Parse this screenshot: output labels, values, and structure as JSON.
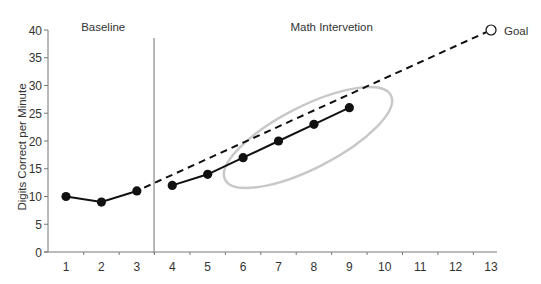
{
  "chart_data": {
    "type": "line",
    "title": "",
    "xlabel": "",
    "ylabel": "Digits Correct per Minute",
    "xlim": [
      0.5,
      13.2
    ],
    "ylim": [
      0,
      40
    ],
    "x_ticks": [
      1,
      2,
      3,
      4,
      5,
      6,
      7,
      8,
      9,
      10,
      11,
      12,
      13
    ],
    "y_ticks": [
      0,
      5,
      10,
      15,
      20,
      25,
      30,
      35,
      40
    ],
    "grid": false,
    "legend": null,
    "phases": [
      {
        "name": "Baseline",
        "label_x": 2.05
      },
      {
        "name": "Math Intervetion",
        "label_x": 8.5
      }
    ],
    "phase_change_x": 3.5,
    "series": [
      {
        "name": "Baseline",
        "style": "solid-markers",
        "x": [
          1,
          2,
          3
        ],
        "values": [
          10,
          9,
          11
        ]
      },
      {
        "name": "Math Intervetion",
        "style": "solid-markers",
        "x": [
          4,
          5,
          6,
          7,
          8,
          9
        ],
        "values": [
          12,
          14,
          17,
          20,
          23,
          26
        ]
      },
      {
        "name": "Aim line",
        "style": "dashed",
        "x": [
          3,
          13
        ],
        "values": [
          11,
          40
        ]
      }
    ],
    "goal": {
      "label": "Goal",
      "x": 13,
      "y": 40,
      "marker": "open-circle"
    },
    "annotations": [
      {
        "type": "ellipse",
        "color": "#c8c8c8",
        "encloses_x": [
          6,
          9
        ],
        "note": "highlights intervention trend points 6-9"
      }
    ],
    "colors": {
      "line": "#111111",
      "axis": "#777777",
      "ellipse": "#c8c8c8",
      "text": "#333333"
    }
  }
}
